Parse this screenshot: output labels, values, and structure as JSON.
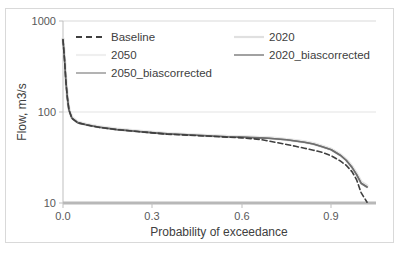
{
  "chart_data": {
    "type": "line",
    "title": "",
    "xlabel": "Probability of exceedance",
    "ylabel": "Flow, m3/s",
    "yscale": "log",
    "ylim": [
      10,
      1000
    ],
    "xlim": [
      0,
      1.05
    ],
    "ytick_labels": [
      "1000",
      "100",
      "10"
    ],
    "ytick_values": [
      1000,
      100,
      10
    ],
    "xtick_labels": [
      "0.0",
      "0.3",
      "0.6",
      "0.9"
    ],
    "xtick_values": [
      0.0,
      0.3,
      0.6,
      0.9
    ],
    "grid": "horizontal",
    "legend_position": "top-inside",
    "series": [
      {
        "name": "Baseline",
        "style": "dashed",
        "color": "#3f3f3f",
        "width": 1.6,
        "x": [
          0.0,
          0.005,
          0.01,
          0.015,
          0.02,
          0.03,
          0.05,
          0.08,
          0.12,
          0.18,
          0.25,
          0.3,
          0.35,
          0.4,
          0.45,
          0.5,
          0.55,
          0.6,
          0.63,
          0.66,
          0.69,
          0.72,
          0.75,
          0.78,
          0.81,
          0.84,
          0.87,
          0.9,
          0.93,
          0.95,
          0.97,
          0.985,
          1.0,
          1.02
        ],
        "y": [
          620,
          380,
          210,
          140,
          105,
          85,
          76,
          72,
          68,
          64,
          61,
          59,
          57,
          56,
          55,
          54,
          53,
          52,
          51,
          50,
          48,
          46,
          44,
          42,
          40,
          38,
          36,
          33,
          29,
          26,
          22,
          18,
          13,
          10.2
        ]
      },
      {
        "name": "2020",
        "style": "solid",
        "color": "#e0e0e0",
        "width": 3.0,
        "x": [
          0.0,
          0.005,
          0.01,
          0.015,
          0.02,
          0.03,
          0.05,
          0.08,
          0.12,
          0.18,
          0.25,
          0.3,
          0.35,
          0.4,
          0.45,
          0.5,
          0.55,
          0.6,
          0.63,
          0.66,
          0.69,
          0.72,
          0.75,
          0.78,
          0.81,
          0.84,
          0.87,
          0.9,
          0.93,
          0.95,
          0.97,
          0.985,
          1.0,
          1.02
        ],
        "y": [
          640,
          390,
          215,
          143,
          107,
          87,
          77,
          73,
          69,
          65,
          62,
          60,
          58,
          57,
          56,
          55,
          54,
          53.5,
          53,
          52.5,
          52,
          51,
          50,
          48.5,
          47,
          45,
          42,
          39,
          34,
          30,
          25,
          21,
          17,
          15.5
        ]
      },
      {
        "name": "2050",
        "style": "solid",
        "color": "#eeeeee",
        "width": 3.0,
        "x": [
          0.0,
          0.005,
          0.01,
          0.015,
          0.02,
          0.03,
          0.05,
          0.08,
          0.12,
          0.18,
          0.25,
          0.3,
          0.35,
          0.4,
          0.45,
          0.5,
          0.55,
          0.6,
          0.63,
          0.66,
          0.69,
          0.72,
          0.75,
          0.78,
          0.81,
          0.84,
          0.87,
          0.9,
          0.93,
          0.95,
          0.97,
          0.985,
          1.0,
          1.02
        ],
        "y": [
          630,
          385,
          212,
          141,
          106,
          86,
          76.5,
          72.5,
          68.5,
          64.5,
          61.5,
          59.5,
          57.5,
          56.5,
          55.5,
          54.5,
          53.5,
          53,
          52.5,
          52,
          51.5,
          50.5,
          49.5,
          48,
          46.5,
          44.5,
          41.5,
          38.5,
          33.5,
          29.5,
          24.5,
          20.5,
          16.5,
          15.0
        ]
      },
      {
        "name": "2020_biascorrected",
        "style": "solid",
        "color": "#6e6e6e",
        "width": 1.6,
        "x": [
          0.0,
          0.005,
          0.01,
          0.015,
          0.02,
          0.03,
          0.05,
          0.08,
          0.12,
          0.18,
          0.25,
          0.3,
          0.35,
          0.4,
          0.45,
          0.5,
          0.55,
          0.6,
          0.63,
          0.66,
          0.69,
          0.72,
          0.75,
          0.78,
          0.81,
          0.84,
          0.87,
          0.9,
          0.93,
          0.95,
          0.97,
          0.985,
          1.0,
          1.02
        ],
        "y": [
          625,
          382,
          211,
          140,
          105,
          85.5,
          76,
          72,
          68,
          64,
          61,
          59,
          57.5,
          56.5,
          55.5,
          54.5,
          53.5,
          53,
          52.5,
          52,
          51.5,
          50.5,
          49.5,
          48,
          46.5,
          44.5,
          41.5,
          38.5,
          33.5,
          29.5,
          24.5,
          20.5,
          16.5,
          15.0
        ]
      },
      {
        "name": "2050_biascorrected",
        "style": "solid",
        "color": "#8a8a8a",
        "width": 1.6,
        "x": [
          0.0,
          0.005,
          0.01,
          0.015,
          0.02,
          0.03,
          0.05,
          0.08,
          0.12,
          0.18,
          0.25,
          0.3,
          0.35,
          0.4,
          0.45,
          0.5,
          0.55,
          0.6,
          0.63,
          0.66,
          0.69,
          0.72,
          0.75,
          0.78,
          0.81,
          0.84,
          0.87,
          0.9,
          0.93,
          0.95,
          0.97,
          0.985,
          1.0,
          1.02
        ],
        "y": [
          628,
          384,
          212,
          141,
          106,
          86,
          76.5,
          72.5,
          68.5,
          64.5,
          61.5,
          59.5,
          57.5,
          56.5,
          55.5,
          54.5,
          53.5,
          53,
          52.5,
          52,
          51.5,
          50.5,
          49.5,
          48,
          46.5,
          44.5,
          41.5,
          38.5,
          33.5,
          29.5,
          24.5,
          20.5,
          16.5,
          15.0
        ]
      }
    ],
    "legend": [
      {
        "label": "Baseline",
        "style": "dashed",
        "color": "#3f3f3f"
      },
      {
        "label": "2020",
        "style": "solid",
        "color": "#e0e0e0"
      },
      {
        "label": "2050",
        "style": "solid",
        "color": "#eeeeee"
      },
      {
        "label": "2020_biascorrected",
        "style": "solid",
        "color": "#6e6e6e"
      },
      {
        "label": "2050_biascorrected",
        "style": "solid",
        "color": "#8a8a8a"
      }
    ]
  },
  "axes": {
    "y_title": "Flow, m3/s",
    "x_title": "Probability of exceedance",
    "y_ticks": {
      "t0": "1000",
      "t1": "100",
      "t2": "10"
    },
    "x_ticks": {
      "t0": "0.0",
      "t1": "0.3",
      "t2": "0.6",
      "t3": "0.9"
    }
  },
  "legend_text": {
    "baseline": "Baseline",
    "y2020": "2020",
    "y2050": "2050",
    "y2020bc": "2020_biascorrected",
    "y2050bc": "2050_biascorrected"
  }
}
